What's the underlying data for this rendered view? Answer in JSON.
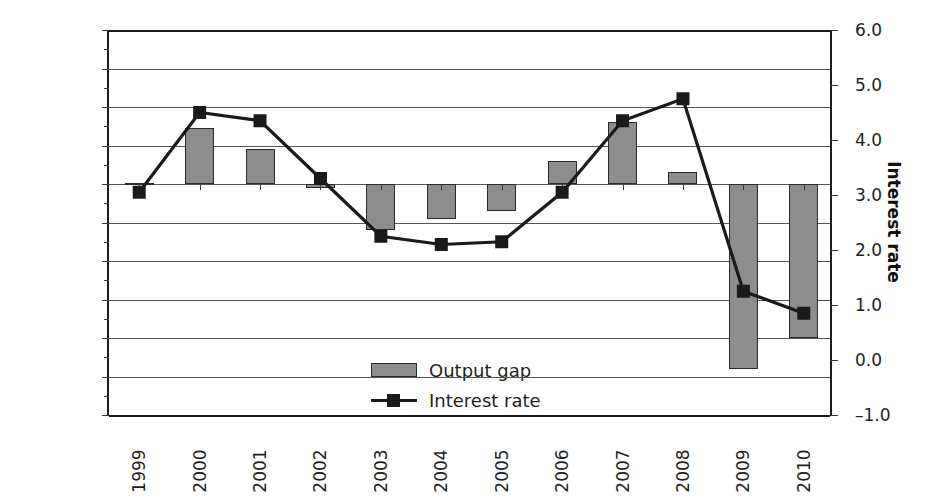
{
  "chart_data": {
    "type": "bar",
    "title": "",
    "xlabel": "",
    "categories": [
      "1999",
      "2000",
      "2001",
      "2002",
      "2003",
      "2004",
      "2005",
      "2006",
      "2007",
      "2008",
      "2009",
      "2010"
    ],
    "series": [
      {
        "name": "Output gap",
        "type": "bar",
        "axis": "left",
        "color": "#8d8d8d",
        "values": [
          0.02,
          1.45,
          0.9,
          -0.1,
          -1.2,
          -0.9,
          -0.7,
          0.6,
          1.6,
          0.3,
          -4.8,
          -4.0
        ]
      },
      {
        "name": "Interest rate",
        "type": "line",
        "axis": "right",
        "color": "#1a1a1a",
        "values": [
          3.05,
          4.5,
          4.35,
          3.3,
          2.25,
          2.1,
          2.15,
          3.05,
          4.35,
          4.75,
          1.25,
          0.85
        ]
      }
    ],
    "left_axis": {
      "label": "Output gap",
      "ticks": [
        "4.0",
        "3.0",
        "2.0",
        "1.0",
        "0.0",
        "–1.0",
        "–2.0",
        "–3.0",
        "–4.0",
        "–5.0",
        "–6.0"
      ],
      "values": [
        4,
        3,
        2,
        1,
        0,
        -1,
        -2,
        -3,
        -4,
        -5,
        -6
      ],
      "min": -6,
      "max": 4
    },
    "right_axis": {
      "label": "Interest rate",
      "ticks": [
        "6.0",
        "5.0",
        "4.0",
        "3.0",
        "2.0",
        "1.0",
        "0.0",
        "–1.0"
      ],
      "values": [
        6,
        5,
        4,
        3,
        2,
        1,
        0,
        -1
      ],
      "min": -1,
      "max": 6
    },
    "legend": {
      "position": "inside-bottom-center",
      "entries": [
        {
          "label": "Output gap",
          "marker": "bar-swatch"
        },
        {
          "label": "Interest rate",
          "marker": "line-square-marker"
        }
      ]
    },
    "grid": true
  }
}
